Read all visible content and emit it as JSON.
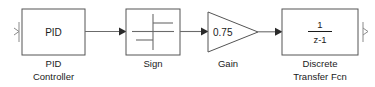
{
  "diagram": {
    "kind": "simulink-block-diagram",
    "background_color": "#ffffff",
    "block_stroke_color": "#545454",
    "signal_color": "#6b6b6b",
    "text_color": "#1a1a1a",
    "blocks": [
      {
        "id": "pid-controller",
        "shape": "rectangle",
        "inner_label": "PID",
        "caption_lines": [
          "PID",
          "Controller"
        ],
        "x": 22,
        "y": 9,
        "w": 63,
        "h": 46
      },
      {
        "id": "sign",
        "shape": "rectangle",
        "inner_label": "",
        "icon": "signum-step-icon",
        "caption_lines": [
          "Sign"
        ],
        "x": 126,
        "y": 9,
        "w": 54,
        "h": 46
      },
      {
        "id": "gain",
        "shape": "triangle",
        "inner_label": "0.75",
        "caption_lines": [
          "Gain"
        ],
        "x": 208,
        "y": 12,
        "w": 50,
        "h": 40
      },
      {
        "id": "discrete-transfer-fcn",
        "shape": "rectangle",
        "inner_numerator": "1",
        "inner_denominator": "z-1",
        "caption_lines": [
          "Discrete",
          "Transfer Fcn"
        ],
        "x": 282,
        "y": 9,
        "w": 76,
        "h": 46
      }
    ],
    "signals": [
      {
        "id": "pid-to-sign",
        "from": "pid-controller",
        "to": "sign"
      },
      {
        "id": "sign-to-gain",
        "from": "sign",
        "to": "gain"
      },
      {
        "id": "gain-to-transfer-fcn",
        "from": "gain",
        "to": "discrete-transfer-fcn"
      }
    ],
    "ports": [
      {
        "id": "input-port",
        "side": "left",
        "glyph": ">"
      },
      {
        "id": "output-port",
        "side": "right",
        "glyph": ">"
      }
    ]
  },
  "labels": {
    "pid_inner": "PID",
    "pid_caption_line1": "PID",
    "pid_caption_line2": "Controller",
    "sign_caption": "Sign",
    "gain_inner": "0.75",
    "gain_caption": "Gain",
    "tf_numerator": "1",
    "tf_denominator": "z-1",
    "tf_caption_line1": "Discrete",
    "tf_caption_line2": "Transfer Fcn"
  }
}
